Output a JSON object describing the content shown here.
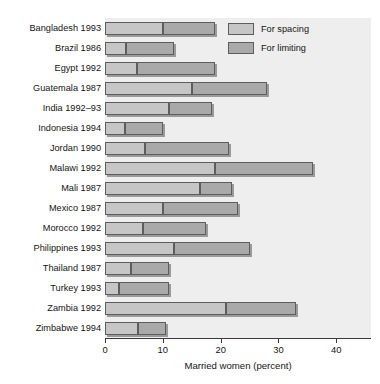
{
  "chart_data": {
    "type": "bar",
    "orientation": "horizontal",
    "stacked": true,
    "title": "",
    "xlabel": "Married women (percent)",
    "ylabel": "",
    "xlim": [
      0,
      46
    ],
    "xticks": [
      0,
      10,
      20,
      30,
      40
    ],
    "xtick_labels": [
      "0",
      "10",
      "20",
      "30",
      "40"
    ],
    "grid": false,
    "legend_position": "top-right",
    "categories": [
      "Bangladesh 1993",
      "Brazil 1986",
      "Egypt 1992",
      "Guatemala 1987",
      "India 1992–93",
      "Indonesia 1994",
      "Jordan 1990",
      "Malawi 1992",
      "Mali 1987",
      "Mexico 1987",
      "Morocco 1992",
      "Philippines 1993",
      "Thailand 1987",
      "Turkey 1993",
      "Zambia 1992",
      "Zimbabwe 1994"
    ],
    "series": [
      {
        "name": "For spacing",
        "color": "#c6c6c6",
        "values": [
          10.0,
          3.7,
          5.6,
          15.0,
          11.0,
          3.5,
          7.0,
          19.0,
          16.5,
          10.0,
          6.5,
          12.0,
          4.5,
          2.5,
          21.0,
          5.7
        ]
      },
      {
        "name": "For limiting",
        "color": "#a9a9a9",
        "values": [
          9.0,
          8.3,
          13.4,
          13.0,
          7.5,
          6.5,
          14.5,
          17.0,
          5.5,
          13.0,
          11.0,
          13.0,
          6.5,
          8.5,
          12.0,
          4.8
        ]
      }
    ],
    "totals": [
      19.0,
      12.0,
      19.0,
      28.0,
      18.5,
      10.0,
      21.5,
      36.0,
      22.0,
      23.0,
      17.5,
      25.0,
      11.0,
      11.0,
      33.0,
      10.5
    ]
  },
  "legend": {
    "items": [
      {
        "label": "For spacing",
        "key": "spacing"
      },
      {
        "label": "For limiting",
        "key": "limiting"
      }
    ]
  },
  "axis": {
    "x_title": "Married women (percent)"
  },
  "colors": {
    "plot_background": "#eeeeee",
    "spacing_fill": "#c6c6c6",
    "limiting_fill": "#a9a9a9",
    "bar_stroke": "#5d5d5d",
    "axis": "#3a3a3a",
    "text": "#141414"
  }
}
